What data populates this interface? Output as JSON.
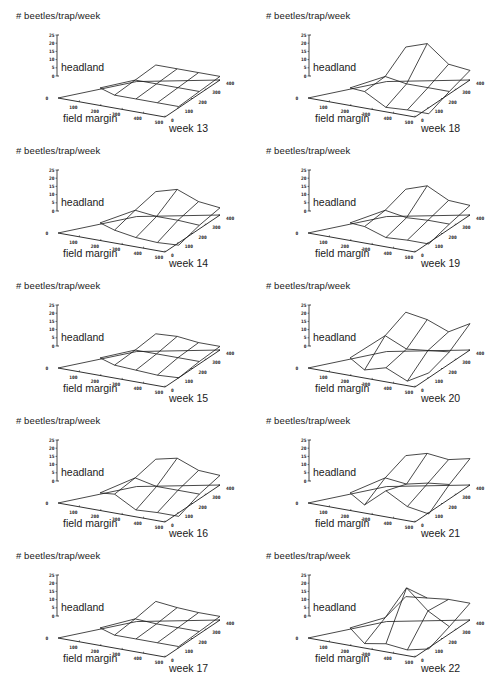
{
  "figure": {
    "y_axis_label": "# beetles/trap/week",
    "x_axis_label": "field margin",
    "headland_label": "headland",
    "z_ticks": [
      "0",
      "5",
      "10",
      "15",
      "20",
      "25"
    ],
    "x_ticks": [
      "0",
      "100",
      "200",
      "300",
      "400",
      "500"
    ],
    "depth_ticks": [
      "0",
      "100",
      "200",
      "300",
      "400"
    ]
  },
  "chart_data": {
    "type": "surface3d",
    "title": "",
    "xlabel": "field margin",
    "ylabel": "distance (0-400)",
    "zlabel": "# beetles/trap/week",
    "xlim": [
      0,
      500
    ],
    "ylim": [
      0,
      400
    ],
    "zlim": [
      0,
      25
    ],
    "grid_x": [
      200,
      300,
      400,
      500
    ],
    "grid_y": [
      100,
      250,
      400
    ],
    "panels": [
      {
        "week": "week 13",
        "z": [
          [
            1,
            1,
            1,
            1
          ],
          [
            2,
            2,
            2,
            2
          ],
          [
            3,
            3,
            3,
            3
          ]
        ]
      },
      {
        "week": "week 14",
        "z": [
          [
            1,
            -2,
            -3,
            -2
          ],
          [
            6,
            4,
            4,
            3
          ],
          [
            10,
            15,
            8,
            6
          ]
        ]
      },
      {
        "week": "week 15",
        "z": [
          [
            1,
            0,
            -1,
            0
          ],
          [
            2,
            2,
            2,
            2
          ],
          [
            4,
            5,
            3,
            3
          ]
        ]
      },
      {
        "week": "week 16",
        "z": [
          [
            6,
            -4,
            -3,
            -3
          ],
          [
            8,
            4,
            4,
            4
          ],
          [
            12,
            16,
            9,
            8
          ]
        ]
      },
      {
        "week": "week 17",
        "z": [
          [
            1,
            1,
            1,
            1
          ],
          [
            3,
            2,
            2,
            2
          ],
          [
            6,
            4,
            3,
            3
          ]
        ]
      },
      {
        "week": "week 18",
        "z": [
          [
            4,
            -6,
            -5,
            -5
          ],
          [
            5,
            2,
            2,
            2
          ],
          [
            18,
            24,
            10,
            8
          ]
        ]
      },
      {
        "week": "week 19",
        "z": [
          [
            4,
            -2,
            -1,
            -1
          ],
          [
            6,
            3,
            4,
            4
          ],
          [
            12,
            18,
            9,
            8
          ]
        ]
      },
      {
        "week": "week 20",
        "z": [
          [
            -3,
            2,
            -6,
            4
          ],
          [
            14,
            6,
            8,
            10
          ],
          [
            22,
            19,
            12,
            22
          ]
        ]
      },
      {
        "week": "week 21",
        "z": [
          [
            -3,
            12,
            2,
            -1
          ],
          [
            8,
            6,
            10,
            12
          ],
          [
            15,
            20,
            18,
            22
          ]
        ]
      },
      {
        "week": "week 22",
        "z": [
          [
            -6,
            -3,
            -5,
            -1
          ],
          [
            4,
            32,
            16,
            6
          ],
          [
            10,
            12,
            14,
            14
          ]
        ]
      }
    ]
  },
  "panels": [
    {
      "week_label": "week 13"
    },
    {
      "week_label": "week 18"
    },
    {
      "week_label": "week 14"
    },
    {
      "week_label": "week 19"
    },
    {
      "week_label": "week 15"
    },
    {
      "week_label": "week 20"
    },
    {
      "week_label": "week 16"
    },
    {
      "week_label": "week 21"
    },
    {
      "week_label": "week 17"
    },
    {
      "week_label": "week 22"
    }
  ]
}
